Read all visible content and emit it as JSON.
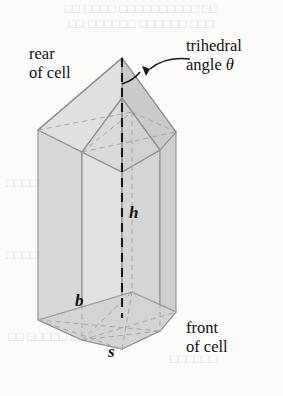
{
  "figure": {
    "background_color": "#fbfbfa",
    "solid_fill_color": "#dcdcdc",
    "solid_fill_light": "#e4e4e4",
    "solid_fill_dark": "#cfcfcf",
    "edge_color": "#8d8d8d",
    "hidden_edge_color": "#a9a9a9",
    "annotation_color": "#111111"
  },
  "labels": {
    "rear_line1": "rear",
    "rear_line2": "of cell",
    "front_line1": "front",
    "front_line2": "of cell",
    "trihedral_line1": "trihedral",
    "trihedral_line2_prefix": "angle ",
    "trihedral_angle_symbol": "θ"
  },
  "variables": {
    "height": "h",
    "base": "b",
    "side": "s"
  },
  "bleed_through": {
    "line1": "□□ □□□□ □□□□□□□□□□ □□",
    "line2": "□□ □□□□□□ □□□□□□ □□□",
    "line3": "□□□□□□□",
    "line4": "□□□□□",
    "line5": "□□ □□□□□ □□□",
    "line6": "□□□□□□"
  },
  "geometry": {
    "apex": [
      122,
      58
    ],
    "upper_hex_front": [
      122,
      172
    ],
    "left_edge_x": 38,
    "right_edge_x": 176,
    "prism_top_y": 130,
    "prism_bottom_y": 320,
    "bottom_front_y": 349,
    "axis_top_y": 58,
    "axis_bottom_y": 318
  }
}
